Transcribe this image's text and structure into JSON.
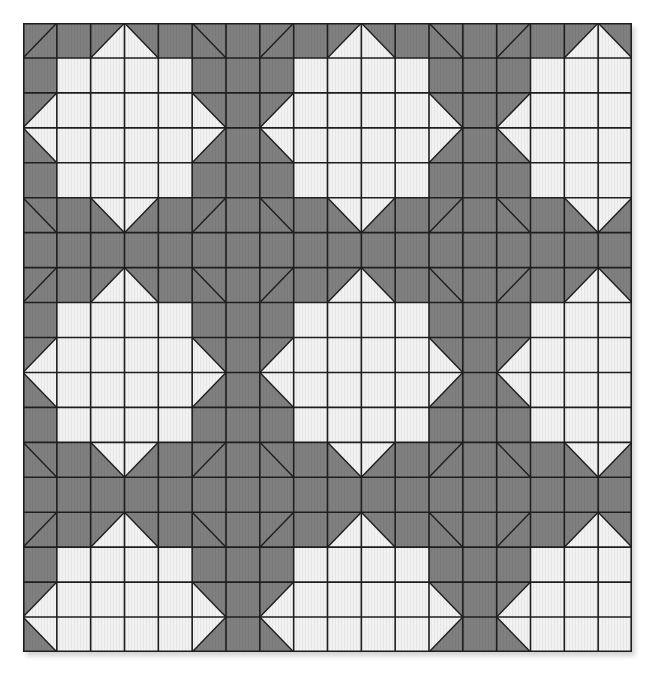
{
  "pattern": {
    "columns": 18,
    "rows": 18,
    "colors": {
      "dark": "#808080",
      "light": "#f2f2f2",
      "line": "#1e1e1e"
    },
    "tile_size": 7,
    "tile": [
      [
        "G/",
        "G",
        "BR",
        "BL",
        "G",
        "G\\",
        "G"
      ],
      [
        "G",
        "W",
        "W",
        "W",
        "W",
        "G",
        "G"
      ],
      [
        "BR",
        "W",
        "W",
        "W",
        "W",
        "BL",
        "G"
      ],
      [
        "TR",
        "W",
        "W",
        "W",
        "W",
        "TL",
        "G"
      ],
      [
        "G",
        "W",
        "W",
        "W",
        "W",
        "G",
        "G"
      ],
      [
        "G\\",
        "G",
        "TR",
        "TL",
        "G",
        "G/",
        "G"
      ],
      [
        "G",
        "G",
        "G",
        "G",
        "G",
        "G",
        "G"
      ]
    ]
  }
}
